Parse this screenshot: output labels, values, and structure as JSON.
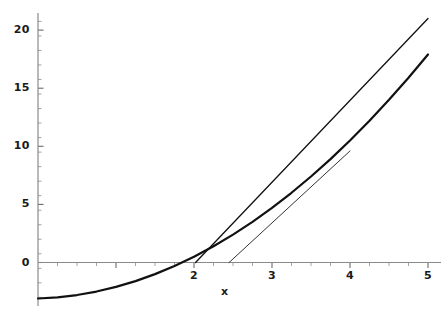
{
  "chart_data": {
    "type": "line",
    "title": "",
    "xlabel": "x",
    "ylabel": "",
    "xlim": [
      0,
      5
    ],
    "ylim": [
      -3.5,
      21.5
    ],
    "grid": false,
    "legend": "none",
    "xticks": [
      2,
      3,
      4,
      5
    ],
    "xticklabels": [
      "2",
      "3",
      "4",
      "5"
    ],
    "yticks": [
      0,
      5,
      10,
      15,
      20
    ],
    "yticklabels": [
      "0",
      "5",
      "10",
      "15",
      "20"
    ],
    "xminor_step": 0.25,
    "yminor_step": 1.25,
    "series": [
      {
        "name": "curve",
        "kind": "curve",
        "expression": "y = x^2 - 4",
        "color": "#111111",
        "linewidth": 2.2,
        "x": [
          0.0,
          0.25,
          0.5,
          0.75,
          1.0,
          1.25,
          1.5,
          1.75,
          2.0,
          2.25,
          2.5,
          2.75,
          3.0,
          3.25,
          3.5,
          3.75,
          4.0,
          4.25,
          4.5,
          4.75,
          5.0
        ],
        "y": [
          -3.1,
          -3.0,
          -2.8,
          -2.5,
          -2.1,
          -1.6,
          -1.0,
          -0.3,
          0.5,
          1.4,
          2.4,
          3.5,
          4.7,
          6.0,
          7.4,
          8.9,
          10.5,
          12.2,
          14.0,
          15.9,
          17.9
        ]
      },
      {
        "name": "tangent-line-long",
        "kind": "line",
        "color": "#111111",
        "linewidth": 1.3,
        "x": [
          2.02,
          5.0
        ],
        "y": [
          0.0,
          21.0
        ]
      },
      {
        "name": "tangent-line-short",
        "kind": "line",
        "color": "#333333",
        "linewidth": 1.0,
        "x": [
          2.45,
          4.0
        ],
        "y": [
          0.0,
          9.6
        ]
      }
    ]
  },
  "axis": {
    "x_title": "x",
    "y_ticklabels": [
      "20",
      "15",
      "10",
      "5",
      "0"
    ],
    "x_ticklabels": [
      "2",
      "3",
      "4",
      "5"
    ]
  },
  "colors": {
    "axis": "#8a8a8a",
    "curve": "#111111",
    "tangent": "#333333",
    "text": "#1a1a1a",
    "background": "#ffffff"
  }
}
